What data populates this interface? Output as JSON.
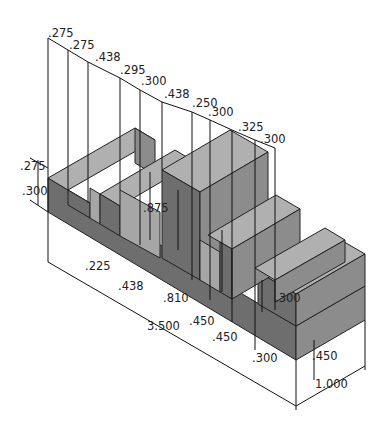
{
  "colors": {
    "front": "#6e6e6e",
    "top": "#b0b0b0",
    "side": "#8c8c8c",
    "slot": "#a6a6a6",
    "line": "#111111",
    "background": "#ffffff"
  },
  "top_dimensions": [
    ".275",
    ".275",
    ".438",
    ".295",
    ".300",
    ".438",
    ".250",
    ".300",
    ".325",
    ".300"
  ],
  "left_dimensions": [
    ".275",
    ".300"
  ],
  "inner_dimensions": {
    "slot_height": ".875",
    "step_height": ".300"
  },
  "bottom_dimensions": [
    ".225",
    ".438",
    ".810",
    ".450",
    ".450",
    ".300",
    ".450"
  ],
  "overall": {
    "length": "3.500",
    "width": "1.000"
  }
}
